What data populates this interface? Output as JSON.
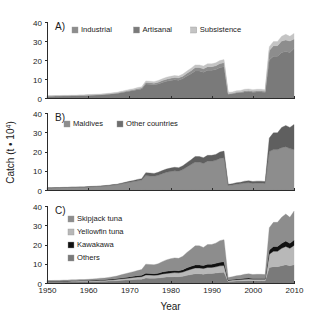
{
  "figure": {
    "width": 320,
    "height": 326,
    "background": "#ffffff",
    "xlabel": "Year",
    "ylabel_prefix": "Catch (t ",
    "ylabel_dot": "•",
    "ylabel_mid": " 10",
    "ylabel_sup": "4",
    "ylabel_suffix": ")"
  },
  "colors": {
    "dark_gray": "#6e6e6e",
    "mid_gray": "#8d8d8d",
    "light_gray": "#b8b8b8",
    "very_light_gray": "#cfcfcf",
    "black": "#111111",
    "axis": "#2b2b2b",
    "text": "#1a1a1a"
  },
  "axes": {
    "x_ticks": [
      "1950",
      "1960",
      "1970",
      "1980",
      "1990",
      "2000",
      "2010"
    ],
    "x_tick_values": [
      1950,
      1960,
      1970,
      1980,
      1990,
      2000,
      2010
    ],
    "xlim": [
      1950,
      2010
    ],
    "y_ticks": [
      "0",
      "10",
      "20",
      "30",
      "40"
    ],
    "y_tick_values": [
      0,
      10,
      20,
      30,
      40
    ],
    "ylim": [
      0,
      40
    ]
  },
  "panels": [
    {
      "letter": "A)",
      "legend": [
        {
          "label": "Industrial",
          "color": "#8d8d8d"
        },
        {
          "label": "Artisanal",
          "color": "#7a7a7a"
        },
        {
          "label": "Subsistence",
          "color": "#c4c4c4"
        }
      ]
    },
    {
      "letter": "B)",
      "legend": [
        {
          "label": "Maldives",
          "color": "#8d8d8d"
        },
        {
          "label": "Other countries",
          "color": "#6e6e6e"
        }
      ]
    },
    {
      "letter": "C)",
      "legend": [
        {
          "label": "Skipjack tuna",
          "color": "#8d8d8d"
        },
        {
          "label": "Yellowfin tuna",
          "color": "#b8b8b8"
        },
        {
          "label": "Kawakawa",
          "color": "#111111"
        },
        {
          "label": "Others",
          "color": "#7a7a7a"
        }
      ]
    }
  ],
  "chart_data": [
    {
      "id": "panel-a",
      "type": "area",
      "title": "A)",
      "xlabel": "",
      "ylabel": "Catch (t * 10^4)",
      "xlim": [
        1950,
        2010
      ],
      "ylim": [
        0,
        40
      ],
      "grid": false,
      "legend_position": "top-left",
      "stacked": true,
      "x": [
        1950,
        1951,
        1952,
        1953,
        1954,
        1955,
        1956,
        1957,
        1958,
        1959,
        1960,
        1961,
        1962,
        1963,
        1964,
        1965,
        1966,
        1967,
        1968,
        1969,
        1970,
        1971,
        1972,
        1973,
        1974,
        1975,
        1976,
        1977,
        1978,
        1979,
        1980,
        1981,
        1982,
        1983,
        1984,
        1985,
        1986,
        1987,
        1988,
        1989,
        1990,
        1991,
        1992,
        1993,
        1994,
        1995,
        1996,
        1997,
        1998,
        1999,
        2000,
        2001,
        2002,
        2003,
        2004,
        2005,
        2006,
        2007,
        2008,
        2009,
        2010
      ],
      "series": [
        {
          "name": "Artisanal",
          "color": "#7a7a7a",
          "values": [
            0.9,
            0.9,
            1.0,
            1.0,
            1.1,
            1.1,
            1.2,
            1.2,
            1.3,
            1.3,
            1.4,
            1.5,
            1.6,
            1.7,
            1.8,
            2.0,
            2.2,
            2.4,
            2.8,
            3.2,
            3.6,
            4.0,
            4.4,
            4.8,
            7.4,
            7.2,
            7.0,
            7.4,
            8.2,
            8.8,
            9.2,
            9.6,
            9.4,
            10.2,
            11.6,
            12.8,
            14.2,
            14.2,
            13.6,
            14.6,
            14.6,
            15.0,
            16.0,
            16.4,
            2.0,
            2.2,
            2.6,
            2.8,
            3.2,
            3.4,
            3.0,
            3.2,
            3.2,
            3.0,
            20.0,
            22.0,
            22.0,
            24.0,
            24.5,
            24.0,
            26.0
          ]
        },
        {
          "name": "Industrial",
          "color": "#8d8d8d",
          "values": [
            0.1,
            0.1,
            0.1,
            0.1,
            0.1,
            0.1,
            0.1,
            0.1,
            0.1,
            0.1,
            0.1,
            0.1,
            0.1,
            0.1,
            0.2,
            0.2,
            0.2,
            0.2,
            0.3,
            0.3,
            0.4,
            0.4,
            0.5,
            0.5,
            0.8,
            0.8,
            0.8,
            0.9,
            1.0,
            1.1,
            1.2,
            1.2,
            1.2,
            1.3,
            1.4,
            1.6,
            1.8,
            1.8,
            1.8,
            1.9,
            1.9,
            2.0,
            2.1,
            2.2,
            0.3,
            0.3,
            0.4,
            0.4,
            0.5,
            0.5,
            0.5,
            0.5,
            0.5,
            0.5,
            5.0,
            5.5,
            5.5,
            6.0,
            6.0,
            6.0,
            5.0
          ]
        },
        {
          "name": "Subsistence",
          "color": "#c4c4c4",
          "values": [
            0.2,
            0.2,
            0.2,
            0.2,
            0.2,
            0.2,
            0.2,
            0.2,
            0.2,
            0.2,
            0.3,
            0.3,
            0.3,
            0.3,
            0.3,
            0.3,
            0.4,
            0.4,
            0.4,
            0.5,
            0.5,
            0.5,
            0.6,
            0.6,
            0.8,
            0.8,
            0.8,
            0.9,
            0.9,
            1.0,
            1.0,
            1.0,
            1.0,
            1.1,
            1.2,
            1.3,
            1.4,
            1.4,
            1.4,
            1.5,
            1.5,
            1.5,
            1.6,
            1.6,
            0.7,
            0.7,
            0.8,
            0.8,
            0.9,
            0.9,
            0.9,
            0.9,
            0.9,
            0.9,
            2.0,
            2.2,
            2.2,
            2.5,
            3.0,
            2.5,
            3.0
          ]
        }
      ]
    },
    {
      "id": "panel-b",
      "type": "area",
      "title": "B)",
      "xlabel": "",
      "ylabel": "Catch (t * 10^4)",
      "xlim": [
        1950,
        2010
      ],
      "ylim": [
        0,
        40
      ],
      "grid": false,
      "legend_position": "top-left",
      "stacked": true,
      "x": [
        1950,
        1951,
        1952,
        1953,
        1954,
        1955,
        1956,
        1957,
        1958,
        1959,
        1960,
        1961,
        1962,
        1963,
        1964,
        1965,
        1966,
        1967,
        1968,
        1969,
        1970,
        1971,
        1972,
        1973,
        1974,
        1975,
        1976,
        1977,
        1978,
        1979,
        1980,
        1981,
        1982,
        1983,
        1984,
        1985,
        1986,
        1987,
        1988,
        1989,
        1990,
        1991,
        1992,
        1993,
        1994,
        1995,
        1996,
        1997,
        1998,
        1999,
        2000,
        2001,
        2002,
        2003,
        2004,
        2005,
        2006,
        2007,
        2008,
        2009,
        2010
      ],
      "series": [
        {
          "name": "Maldives",
          "color": "#8d8d8d",
          "values": [
            1.1,
            1.1,
            1.2,
            1.2,
            1.3,
            1.3,
            1.4,
            1.4,
            1.5,
            1.5,
            1.6,
            1.7,
            1.8,
            1.9,
            2.0,
            2.3,
            2.5,
            2.8,
            3.2,
            3.6,
            4.0,
            4.4,
            4.8,
            5.2,
            7.5,
            7.3,
            7.2,
            7.6,
            8.5,
            9.2,
            9.6,
            10.0,
            9.8,
            10.6,
            12.0,
            13.2,
            14.5,
            14.5,
            13.8,
            15.0,
            15.0,
            15.4,
            16.4,
            16.8,
            2.4,
            2.6,
            3.0,
            3.2,
            3.6,
            3.8,
            3.4,
            3.6,
            3.6,
            3.4,
            20.0,
            21.0,
            21.0,
            22.0,
            22.5,
            21.5,
            21.0
          ]
        },
        {
          "name": "Other countries",
          "color": "#5f5f5f",
          "values": [
            0.1,
            0.1,
            0.1,
            0.1,
            0.1,
            0.1,
            0.1,
            0.1,
            0.1,
            0.1,
            0.2,
            0.2,
            0.2,
            0.2,
            0.3,
            0.2,
            0.3,
            0.2,
            0.3,
            0.4,
            0.5,
            0.5,
            0.7,
            0.7,
            1.5,
            1.5,
            1.4,
            1.6,
            1.6,
            1.7,
            1.8,
            1.8,
            1.8,
            2.0,
            2.2,
            2.5,
            2.9,
            2.9,
            3.0,
            3.0,
            3.0,
            3.1,
            3.3,
            3.4,
            0.6,
            0.6,
            0.8,
            0.8,
            1.0,
            1.0,
            1.0,
            1.0,
            1.0,
            1.0,
            7.0,
            8.7,
            8.7,
            10.5,
            11.0,
            11.0,
            13.0
          ]
        }
      ]
    },
    {
      "id": "panel-c",
      "type": "area",
      "title": "C)",
      "xlabel": "Year",
      "ylabel": "Catch (t * 10^4)",
      "xlim": [
        1950,
        2010
      ],
      "ylim": [
        0,
        40
      ],
      "grid": false,
      "legend_position": "top-left",
      "stacked": true,
      "x": [
        1950,
        1951,
        1952,
        1953,
        1954,
        1955,
        1956,
        1957,
        1958,
        1959,
        1960,
        1961,
        1962,
        1963,
        1964,
        1965,
        1966,
        1967,
        1968,
        1969,
        1970,
        1971,
        1972,
        1973,
        1974,
        1975,
        1976,
        1977,
        1978,
        1979,
        1980,
        1981,
        1982,
        1983,
        1984,
        1985,
        1986,
        1987,
        1988,
        1989,
        1990,
        1991,
        1992,
        1993,
        1994,
        1995,
        1996,
        1997,
        1998,
        1999,
        2000,
        2001,
        2002,
        2003,
        2004,
        2005,
        2006,
        2007,
        2008,
        2009,
        2010
      ],
      "series": [
        {
          "name": "Others",
          "color": "#7a7a7a",
          "values": [
            0.5,
            0.5,
            0.5,
            0.5,
            0.6,
            0.6,
            0.6,
            0.6,
            0.7,
            0.7,
            0.7,
            0.8,
            0.8,
            0.9,
            0.9,
            1.0,
            1.1,
            1.2,
            1.4,
            1.5,
            1.6,
            1.8,
            1.9,
            2.0,
            2.6,
            2.5,
            2.5,
            2.6,
            2.9,
            3.1,
            3.2,
            3.3,
            3.3,
            3.5,
            4.0,
            4.4,
            4.8,
            4.8,
            4.6,
            5.0,
            5.0,
            5.2,
            5.5,
            5.6,
            0.8,
            0.9,
            1.0,
            1.1,
            1.2,
            1.3,
            1.2,
            1.2,
            1.2,
            1.2,
            8.0,
            8.5,
            8.5,
            9.0,
            9.5,
            9.0,
            9.5
          ]
        },
        {
          "name": "Yellowfin tuna",
          "color": "#b8b8b8",
          "values": [
            0.3,
            0.3,
            0.3,
            0.3,
            0.3,
            0.3,
            0.4,
            0.4,
            0.4,
            0.4,
            0.4,
            0.4,
            0.5,
            0.5,
            0.5,
            0.6,
            0.6,
            0.7,
            0.8,
            0.9,
            1.0,
            1.1,
            1.2,
            1.3,
            1.6,
            1.6,
            1.5,
            1.6,
            1.8,
            1.9,
            2.0,
            2.1,
            2.0,
            2.2,
            2.5,
            2.8,
            3.0,
            3.0,
            2.9,
            3.1,
            3.1,
            3.2,
            3.4,
            3.5,
            0.5,
            0.6,
            0.7,
            0.7,
            0.8,
            0.8,
            0.8,
            0.8,
            0.8,
            0.8,
            7.0,
            8.0,
            8.0,
            9.0,
            9.5,
            9.0,
            10.0
          ]
        },
        {
          "name": "Kawakawa",
          "color": "#111111",
          "values": [
            0.15,
            0.15,
            0.15,
            0.15,
            0.2,
            0.2,
            0.2,
            0.2,
            0.2,
            0.2,
            0.2,
            0.25,
            0.25,
            0.3,
            0.3,
            0.3,
            0.35,
            0.4,
            0.45,
            0.5,
            0.55,
            0.6,
            0.65,
            0.7,
            0.9,
            0.9,
            0.85,
            0.9,
            1.0,
            1.1,
            1.1,
            1.15,
            1.1,
            1.2,
            1.4,
            1.5,
            1.6,
            1.6,
            1.6,
            1.7,
            1.7,
            1.8,
            1.9,
            1.9,
            0.3,
            0.3,
            0.35,
            0.4,
            0.45,
            0.45,
            0.4,
            0.4,
            0.4,
            0.4,
            2.2,
            2.5,
            2.5,
            2.6,
            2.8,
            2.6,
            2.8
          ]
        },
        {
          "name": "Skipjack tuna",
          "color": "#8d8d8d",
          "values": [
            0.35,
            0.35,
            0.4,
            0.4,
            0.4,
            0.4,
            0.45,
            0.45,
            0.5,
            0.5,
            0.6,
            0.65,
            0.7,
            0.8,
            0.9,
            1.0,
            1.2,
            1.3,
            1.6,
            1.9,
            2.2,
            2.4,
            2.7,
            3.0,
            4.7,
            4.6,
            4.6,
            4.9,
            5.4,
            5.9,
            6.3,
            6.5,
            6.4,
            7.0,
            8.0,
            8.8,
            9.9,
            9.9,
            9.4,
            10.2,
            10.2,
            10.5,
            11.2,
            11.5,
            1.3,
            1.4,
            1.7,
            1.8,
            2.1,
            2.2,
            2.0,
            2.1,
            2.1,
            2.0,
            11.5,
            12.5,
            12.5,
            13.5,
            14.0,
            13.5,
            15.0
          ]
        }
      ]
    }
  ]
}
